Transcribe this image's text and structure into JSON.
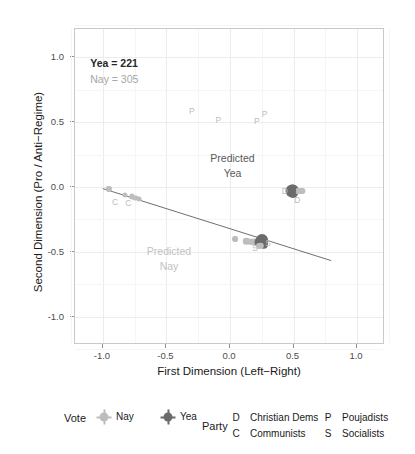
{
  "chart_data": {
    "type": "scatter",
    "title": "",
    "xlabel": "First Dimension (Left−Right)",
    "ylabel": "Second Dimension (Pro / Anti−Regime)",
    "xlim": [
      -1.22,
      1.22
    ],
    "ylim": [
      -1.22,
      1.22
    ],
    "xticks": [
      "-1.0",
      "-0.5",
      "0.0",
      "0.5",
      "1.0"
    ],
    "xtick_values": [
      -1.0,
      -0.5,
      0.0,
      0.5,
      1.0
    ],
    "yticks": [
      "-1.0",
      "-0.5",
      "0.0",
      "0.5",
      "1.0"
    ],
    "ytick_values": [
      -1.0,
      -0.5,
      0.0,
      0.5,
      1.0
    ],
    "grid": true,
    "legend_position": "bottom",
    "annotations": [
      {
        "name": "yea-count",
        "text": "Yea = 221",
        "x": -1.1,
        "y": 1.0,
        "color": "#262626"
      },
      {
        "name": "nay-count",
        "text": "Nay = 305",
        "x": -1.1,
        "y": 0.88,
        "color": "#a6a6a6"
      },
      {
        "name": "predicted-yea",
        "line1": "Predicted",
        "line2": "Yea",
        "x": 0.02,
        "y": 0.28,
        "color": "#595959"
      },
      {
        "name": "predicted-nay",
        "line1": "Predicted",
        "line2": "Nay",
        "x": -0.48,
        "y": -0.44,
        "color": "#c2c2c2"
      }
    ],
    "cutting_line": {
      "name": "cutting-line",
      "x0": -1.0,
      "y0": -0.02,
      "x1": 0.81,
      "y1": -0.58,
      "color": "#6e6e6e"
    },
    "series": [
      {
        "name": "Nay",
        "vote": "nay",
        "color": "#bdbdbd",
        "marker": "circle"
      },
      {
        "name": "Yea",
        "vote": "yea",
        "color": "#6b6b6b",
        "marker": "circle"
      }
    ],
    "parties": [
      {
        "symbol": "D",
        "label": "Christian Dems"
      },
      {
        "symbol": "C",
        "label": "Communists"
      },
      {
        "symbol": "P",
        "label": "Poujadists"
      },
      {
        "symbol": "S",
        "label": "Socialists"
      }
    ],
    "points": [
      {
        "x": -0.3,
        "y": 0.585,
        "party": "P",
        "vote": "nay",
        "r": 0
      },
      {
        "x": -0.092,
        "y": 0.52,
        "party": "P",
        "vote": "nay",
        "r": 0
      },
      {
        "x": 0.212,
        "y": 0.512,
        "party": "P",
        "vote": "nay",
        "r": 0
      },
      {
        "x": 0.272,
        "y": 0.562,
        "party": "P",
        "vote": "nay",
        "r": 0
      },
      {
        "x": -0.955,
        "y": -0.018,
        "party": "C",
        "vote": "nay",
        "r": 3.0
      },
      {
        "x": -0.825,
        "y": -0.062,
        "party": "C",
        "vote": "nay",
        "r": 2.6
      },
      {
        "x": -0.775,
        "y": -0.072,
        "party": "C",
        "vote": "nay",
        "r": 2.6
      },
      {
        "x": -0.745,
        "y": -0.086,
        "party": "C",
        "vote": "nay",
        "r": 2.6
      },
      {
        "x": -0.715,
        "y": -0.095,
        "party": "C",
        "vote": "nay",
        "r": 2.4
      },
      {
        "x": 0.462,
        "y": -0.028,
        "party": "D",
        "vote": "nay",
        "r": 3.0
      },
      {
        "x": 0.488,
        "y": -0.03,
        "party": "D",
        "vote": "yea",
        "r": 6.5
      },
      {
        "x": 0.498,
        "y": -0.022,
        "party": "D",
        "vote": "yea",
        "r": 5.5
      },
      {
        "x": 0.492,
        "y": -0.048,
        "party": "D",
        "vote": "yea",
        "r": 5.0
      },
      {
        "x": 0.54,
        "y": -0.028,
        "party": "D",
        "vote": "nay",
        "r": 3.0
      },
      {
        "x": 0.568,
        "y": -0.028,
        "party": "D",
        "vote": "nay",
        "r": 3.0
      },
      {
        "x": 0.53,
        "y": -0.092,
        "party": "D",
        "vote": "nay",
        "r": 0
      },
      {
        "x": 0.042,
        "y": -0.4,
        "party": "S",
        "vote": "nay",
        "r": 3.0
      },
      {
        "x": 0.128,
        "y": -0.418,
        "party": "S",
        "vote": "nay",
        "r": 3.2
      },
      {
        "x": 0.16,
        "y": -0.424,
        "party": "S",
        "vote": "nay",
        "r": 3.2
      },
      {
        "x": 0.185,
        "y": -0.428,
        "party": "S",
        "vote": "nay",
        "r": 3.4
      },
      {
        "x": 0.205,
        "y": -0.43,
        "party": "S",
        "vote": "nay",
        "r": 3.4
      },
      {
        "x": 0.222,
        "y": -0.432,
        "party": "S",
        "vote": "nay",
        "r": 3.6
      },
      {
        "x": 0.238,
        "y": -0.426,
        "party": "S",
        "vote": "yea",
        "r": 5.5
      },
      {
        "x": 0.252,
        "y": -0.412,
        "party": "S",
        "vote": "yea",
        "r": 6.0
      },
      {
        "x": 0.258,
        "y": -0.434,
        "party": "S",
        "vote": "yea",
        "r": 5.0
      },
      {
        "x": 0.268,
        "y": -0.446,
        "party": "S",
        "vote": "yea",
        "r": 4.2
      },
      {
        "x": 0.244,
        "y": -0.452,
        "party": "S",
        "vote": "nay",
        "r": 3.2
      },
      {
        "x": 0.228,
        "y": -0.456,
        "party": "S",
        "vote": "nay",
        "r": 3.0
      },
      {
        "x": 0.3,
        "y": -0.43,
        "party": "S",
        "vote": "nay",
        "r": 0
      },
      {
        "x": 0.198,
        "y": -0.462,
        "party": "S",
        "vote": "nay",
        "r": 0
      }
    ],
    "point_labels": [
      {
        "text": "P",
        "x": -0.3,
        "y": 0.585,
        "vote": "nay"
      },
      {
        "text": "P",
        "x": -0.092,
        "y": 0.52,
        "vote": "nay"
      },
      {
        "text": "P",
        "x": 0.212,
        "y": 0.512,
        "vote": "nay"
      },
      {
        "text": "P",
        "x": 0.272,
        "y": 0.562,
        "vote": "nay"
      },
      {
        "text": "C",
        "x": -0.955,
        "y": -0.018,
        "vote": "nay"
      },
      {
        "text": "C",
        "x": -0.905,
        "y": -0.118,
        "vote": "nay"
      },
      {
        "text": "C",
        "x": -0.8,
        "y": -0.12,
        "vote": "nay"
      },
      {
        "text": "D",
        "x": 0.432,
        "y": -0.028,
        "vote": "nay"
      },
      {
        "text": "D",
        "x": 0.54,
        "y": -0.028,
        "vote": "nay"
      },
      {
        "text": "D",
        "x": 0.572,
        "y": -0.028,
        "vote": "nay"
      },
      {
        "text": "D",
        "x": 0.53,
        "y": -0.098,
        "vote": "nay"
      },
      {
        "text": "S",
        "x": 0.042,
        "y": -0.4,
        "vote": "nay"
      },
      {
        "text": "S",
        "x": 0.3,
        "y": -0.43,
        "vote": "nay"
      },
      {
        "text": "S",
        "x": 0.198,
        "y": -0.468,
        "vote": "nay"
      }
    ]
  },
  "legend": {
    "vote_title": "Vote",
    "vote_items": [
      {
        "label": "Nay",
        "color": "#bdbdbd"
      },
      {
        "label": "Yea",
        "color": "#6b6b6b"
      }
    ],
    "party_title": "Party",
    "party_items": [
      {
        "symbol": "D",
        "label": "Christian Dems"
      },
      {
        "symbol": "C",
        "label": "Communists"
      },
      {
        "symbol": "P",
        "label": "Poujadists"
      },
      {
        "symbol": "S",
        "label": "Socialists"
      }
    ]
  }
}
